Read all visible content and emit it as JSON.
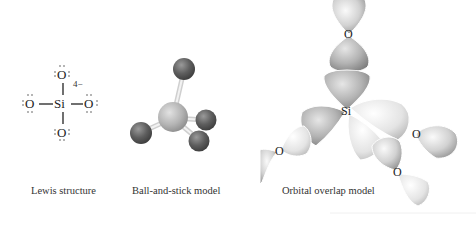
{
  "figure": {
    "panels": [
      {
        "id": "lewis",
        "caption": "Lewis structure",
        "central_atom": "Si",
        "ligands": [
          "O",
          "O",
          "O",
          "O"
        ],
        "charge": "4−",
        "lone_pair_glyph": ":Ö:"
      },
      {
        "id": "ball_and_stick",
        "caption": "Ball-and-stick model",
        "central_atom": "Si",
        "ligand_count": 4
      },
      {
        "id": "orbital_overlap",
        "caption": "Orbital overlap model",
        "central_atom": "Si",
        "ligand_labels": [
          "O",
          "O",
          "O",
          "O"
        ]
      }
    ],
    "colors": {
      "background": "#ffffff",
      "text": "#222222",
      "ball_central": "#b4b4b4",
      "ball_ligand": "#5e5e5e",
      "stick": "#e6e6e6",
      "orbital_light": "#f2f2f2",
      "orbital_mid": "#c8c8c8",
      "orbital_dark": "#8f8f8f"
    }
  }
}
